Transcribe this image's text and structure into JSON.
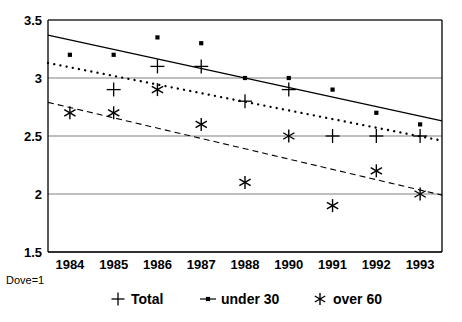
{
  "caption": "Dove=1",
  "chart_data": {
    "type": "scatter",
    "title": "",
    "subtitle": "",
    "xlabel": "",
    "ylabel": "",
    "x": [
      "1984",
      "1985",
      "1986",
      "1987",
      "1988",
      "1990",
      "1991",
      "1992",
      "1993"
    ],
    "categories": [
      "1984",
      "1985",
      "1986",
      "1987",
      "1988",
      "1990",
      "1991",
      "1992",
      "1993"
    ],
    "xtick_labels": [
      "1984",
      "1985",
      "1986",
      "1987",
      "1988",
      "1990",
      "1991",
      "1992",
      "1993"
    ],
    "ytick_labels": [
      "1.5",
      "2",
      "2.5",
      "3",
      "3.5"
    ],
    "yticks": [
      1.5,
      2,
      2.5,
      3,
      3.5
    ],
    "ylim": [
      1.5,
      3.5
    ],
    "grid": true,
    "grid_axis": "y",
    "legend_position": "bottom",
    "series": [
      {
        "name": "Total",
        "marker": "plus",
        "color": "#000000",
        "trendline": "dotted",
        "values": [
          null,
          2.9,
          3.1,
          3.1,
          2.8,
          2.9,
          2.5,
          2.5,
          2.5
        ],
        "trend_start": 3.13,
        "trend_end": 2.46
      },
      {
        "name": "under 30",
        "marker": "square",
        "color": "#000000",
        "trendline": "solid",
        "values": [
          3.2,
          3.2,
          3.35,
          3.3,
          3.0,
          3.0,
          2.9,
          2.7,
          2.6
        ],
        "trend_start": 3.37,
        "trend_end": 2.63
      },
      {
        "name": "over 60",
        "marker": "asterisk",
        "color": "#000000",
        "trendline": "dashed",
        "values": [
          2.7,
          2.7,
          2.9,
          2.6,
          2.1,
          2.5,
          1.9,
          2.2,
          2.0
        ],
        "trend_start": 2.79,
        "trend_end": 1.99
      }
    ]
  },
  "legend": {
    "entries": [
      {
        "label": "Total",
        "marker": "plus"
      },
      {
        "label": "under 30",
        "marker": "square-line"
      },
      {
        "label": "over 60",
        "marker": "asterisk"
      }
    ]
  }
}
